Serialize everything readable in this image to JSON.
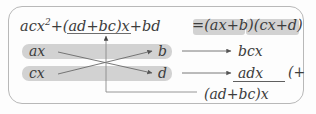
{
  "figure": {
    "border_color": "#b8b8b8",
    "highlight_color": "#d2d2d2",
    "ink_color": "#3c3c3c"
  },
  "equation": {
    "lhs_part1": "acx",
    "lhs_exponent": "2",
    "lhs_part2": "+(ad+bc)x+bd",
    "equals": "=",
    "factor1": "(ax+b)",
    "factor2": "(cx+d)"
  },
  "cross": {
    "top_left": "ax",
    "bottom_left": "cx",
    "top_right": "b",
    "bottom_right": "d"
  },
  "products": {
    "first": "bcx",
    "second": "adx",
    "plus_mark": "(+",
    "sum": "(ad+bc)x"
  }
}
